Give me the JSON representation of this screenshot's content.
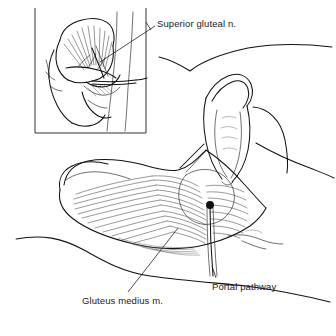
{
  "figure": {
    "kind": "medical-line-illustration",
    "width": 336,
    "height": 336,
    "style": "black-and-white pen-and-ink anatomical drawing",
    "background_color": "#ffffff",
    "ink_color": "#111111"
  },
  "labels": {
    "superior_gluteal_nerve": "Superior gluteal n.",
    "gluteus_medius_muscle": "Gluteus medius m.",
    "portal_pathway": "Portal pathway"
  },
  "annotations": [
    {
      "id": "superior-gluteal-n",
      "text": "Superior gluteal n.",
      "text_x": 157,
      "text_y": 18,
      "leader_from": [
        155,
        27
      ],
      "leader_to": [
        100,
        62
      ],
      "target": "inset panel, deep surface of gluteus medius"
    },
    {
      "id": "gluteus-medius-m",
      "text": "Gluteus medius m.",
      "text_x": 82,
      "text_y": 295,
      "leader_from": [
        128,
        293
      ],
      "leader_to": [
        178,
        228
      ],
      "target": "fanned muscle belly of the main illustration"
    },
    {
      "id": "portal-pathway",
      "text": "Portal pathway",
      "text_x": 212,
      "text_y": 281,
      "leader_from": [
        215,
        278
      ],
      "leader_to": [
        210,
        205
      ],
      "target": "black entry dot over the greater trochanter region"
    }
  ],
  "inset_panel": {
    "name": "bony-pelvis-inset",
    "x": 35,
    "y": 8,
    "width": 111,
    "height": 125,
    "border_sides": [
      "left",
      "right",
      "bottom"
    ],
    "contents": [
      "ilium / iliac crest outline",
      "radiating gluteus medius fibers",
      "greater trochanter",
      "superior gluteal nerve branches",
      "needle / portal instrument crossing the field",
      "lateral thigh skin contour"
    ]
  },
  "main_illustration": {
    "name": "lateral-hip-view",
    "contents": [
      "flexed thigh and knee raised at upper right",
      "buttock arc at right",
      "fanned gluteus medius muscle belly",
      "iliac crest ridge along the top of the muscle",
      "black portal entry dot",
      "portal pathway instrument line",
      "upper torso V contour",
      "lower body wavy skin contour"
    ]
  },
  "portal_marker": {
    "name": "portal-entry-dot",
    "x": 210,
    "y": 205,
    "radius": 4,
    "color": "#111111"
  }
}
